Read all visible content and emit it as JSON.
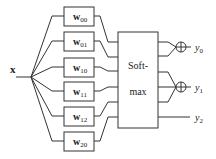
{
  "diagram": {
    "input": {
      "label": "x"
    },
    "weights": [
      {
        "base": "w",
        "sub": "00"
      },
      {
        "base": "w",
        "sub": "01"
      },
      {
        "base": "w",
        "sub": "10"
      },
      {
        "base": "w",
        "sub": "11"
      },
      {
        "base": "w",
        "sub": "12"
      },
      {
        "base": "w",
        "sub": "20"
      }
    ],
    "softmax": {
      "line1": "Soft-",
      "line2": "max"
    },
    "sum_symbol": "⊕",
    "outputs": [
      {
        "base": "y",
        "sub": "0"
      },
      {
        "base": "y",
        "sub": "1"
      },
      {
        "base": "y",
        "sub": "2"
      }
    ]
  }
}
